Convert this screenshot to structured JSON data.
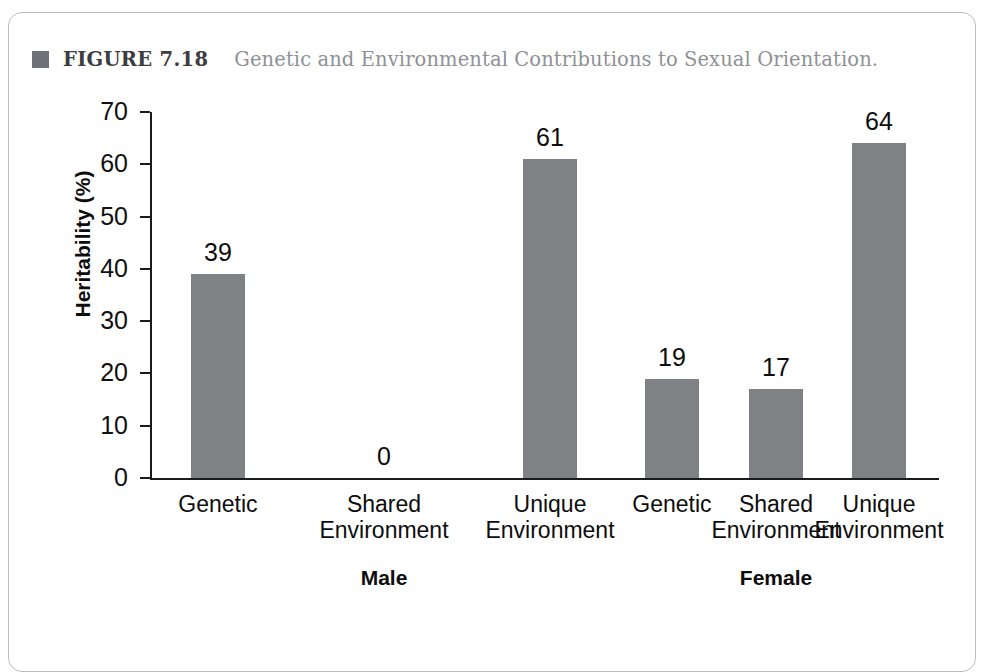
{
  "figure": {
    "bullet_icon": "filled-square-icon",
    "label": "FIGURE 7.18",
    "caption": "Genetic and Environmental Contributions to Sexual Orientation."
  },
  "colors": {
    "bar": "#7f8184",
    "bullet": "#6f7276",
    "caption_text": "#8e9195",
    "axis": "#1b1b1b"
  },
  "chart_data": {
    "type": "bar",
    "title": "Genetic and Environmental Contributions to Sexual Orientation.",
    "xlabel": "",
    "ylabel": "Heritability (%)",
    "ylim": [
      0,
      70
    ],
    "yticks": [
      0,
      10,
      20,
      30,
      40,
      50,
      60,
      70
    ],
    "ytick_labels": [
      "0",
      "10",
      "20",
      "30",
      "40",
      "50",
      "60",
      "70"
    ],
    "grid": false,
    "legend": false,
    "categories": [
      "Genetic",
      "Shared Environment",
      "Unique Environment",
      "Genetic",
      "Shared Environment",
      "Unique Environment"
    ],
    "category_lines": [
      [
        "Genetic",
        ""
      ],
      [
        "Shared",
        "Environment"
      ],
      [
        "Unique",
        "Environment"
      ],
      [
        "Genetic",
        ""
      ],
      [
        "Shared",
        "Environment"
      ],
      [
        "Unique",
        "Environment"
      ]
    ],
    "values": [
      39,
      0,
      61,
      19,
      17,
      64
    ],
    "value_labels": [
      "39",
      "0",
      "61",
      "19",
      "17",
      "64"
    ],
    "groups": [
      {
        "name": "Male",
        "category_indices": [
          0,
          1,
          2
        ]
      },
      {
        "name": "Female",
        "category_indices": [
          3,
          4,
          5
        ]
      }
    ],
    "group_labels": [
      "Male",
      "Female"
    ]
  }
}
